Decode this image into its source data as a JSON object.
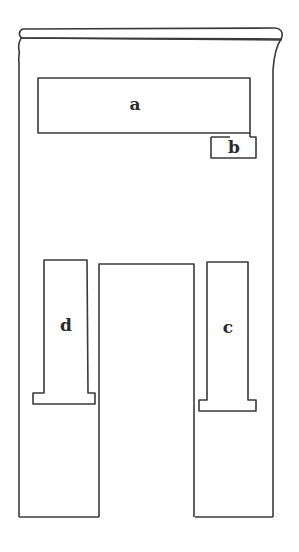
{
  "diagram": {
    "type": "stele-outline",
    "stroke_color": "#3a3a3a",
    "background": "#ffffff",
    "labels": [
      {
        "id": "a",
        "text": "a",
        "x": 135,
        "y": 104
      },
      {
        "id": "b",
        "text": "b",
        "x": 234,
        "y": 147
      },
      {
        "id": "c",
        "text": "c",
        "x": 228,
        "y": 327
      },
      {
        "id": "d",
        "text": "d",
        "x": 66,
        "y": 325
      }
    ]
  }
}
